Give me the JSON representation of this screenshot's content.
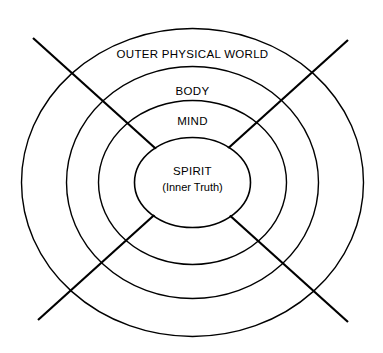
{
  "diagram": {
    "type": "concentric-ellipse-layers",
    "title": "",
    "background_color": "#ffffff",
    "stroke_color": "#000000",
    "text_color": "#000000",
    "canvas": {
      "width": 383,
      "height": 353
    },
    "center": {
      "x": 192.5,
      "y": 182.5
    },
    "layers": [
      {
        "key": "outer_physical_world",
        "label": "OUTER PHYSICAL WORLD",
        "order": 1,
        "rx": 171,
        "ry": 154,
        "stroke_width": 1.4,
        "label_x": 192.5,
        "label_y": 55
      },
      {
        "key": "body",
        "label": "BODY",
        "order": 2,
        "rx": 126,
        "ry": 116,
        "stroke_width": 1.4,
        "label_x": 192.5,
        "label_y": 92
      },
      {
        "key": "mind",
        "label": "MIND",
        "order": 3,
        "rx": 94,
        "ry": 82,
        "stroke_width": 1.4,
        "label_x": 192.5,
        "label_y": 122
      },
      {
        "key": "spirit",
        "label": "SPIRIT",
        "sublabel": "(Inner Truth)",
        "order": 4,
        "rx": 58,
        "ry": 45,
        "stroke_width": 1.6,
        "label_x": 192.5,
        "label_y": 172,
        "sublabel_x": 192.5,
        "sublabel_y": 188
      }
    ],
    "axes": [
      {
        "key": "diagonal-down-right",
        "x1": 33,
        "y1": 38,
        "x2": 348,
        "y2": 322,
        "stroke_width": 2.2
      },
      {
        "key": "diagonal-down-left",
        "x1": 348,
        "y1": 40,
        "x2": 38,
        "y2": 320,
        "stroke_width": 2.2
      }
    ]
  }
}
